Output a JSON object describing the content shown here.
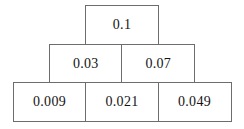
{
  "pyramid": {
    "description": "number pyramid with three rows",
    "rows": [
      {
        "cells": [
          "0.1"
        ]
      },
      {
        "cells": [
          "0.03",
          "0.07"
        ]
      },
      {
        "cells": [
          "0.009",
          "0.021",
          "0.049"
        ]
      }
    ]
  },
  "colors": {
    "background": "#ffffff",
    "border": "#6d6d6d",
    "text": "#141414"
  }
}
